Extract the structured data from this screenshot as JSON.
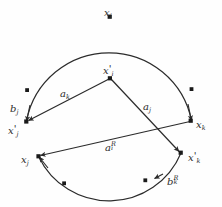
{
  "figure": {
    "type": "geometric-diagram",
    "background_color": "#fefefe",
    "stroke_color": "#2b2b2b",
    "text_color": "#2b2b2b"
  },
  "labels": {
    "x_i": {
      "base": "x",
      "sub": "i",
      "prime": "",
      "sup": ""
    },
    "x_i_prime": {
      "base": "x",
      "sub": "i",
      "prime": "'",
      "sup": ""
    },
    "x_j": {
      "base": "x",
      "sub": "j",
      "prime": "",
      "sup": ""
    },
    "x_j_prime": {
      "base": "x",
      "sub": "j",
      "prime": "'",
      "sup": ""
    },
    "x_k": {
      "base": "x",
      "sub": "k",
      "prime": "",
      "sup": ""
    },
    "x_k_prime": {
      "base": "x",
      "sub": "k",
      "prime": "'",
      "sup": ""
    },
    "a_k": {
      "base": "a",
      "sub": "k",
      "prime": "",
      "sup": ""
    },
    "a_j": {
      "base": "a",
      "sub": "j",
      "prime": "",
      "sup": ""
    },
    "a_i_R": {
      "base": "a",
      "sub": "i",
      "prime": "",
      "sup": "R"
    },
    "b_j": {
      "base": "b",
      "sub": "j",
      "prime": "",
      "sup": ""
    },
    "b_k_R": {
      "base": "b",
      "sub": "k",
      "prime": "",
      "sup": "R"
    }
  },
  "geometry": {
    "points": {
      "x_i": {
        "x": 110,
        "y": 17
      },
      "x_i_prime": {
        "x": 110,
        "y": 78
      },
      "x_j_prime": {
        "x": 26,
        "y": 122
      },
      "x_k": {
        "x": 191,
        "y": 121
      },
      "x_j": {
        "x": 38,
        "y": 156
      },
      "x_k_prime": {
        "x": 181,
        "y": 153
      }
    },
    "arc_dots": [
      {
        "x": 110,
        "y": 17
      },
      {
        "x": 27,
        "y": 90
      },
      {
        "x": 192,
        "y": 89
      },
      {
        "x": 64,
        "y": 183
      },
      {
        "x": 145,
        "y": 180
      }
    ],
    "edges": [
      {
        "name": "a_k",
        "from": "x_i_prime",
        "to": "x_j_prime",
        "kind": "straight-arrow"
      },
      {
        "name": "a_j",
        "from": "x_i_prime",
        "to": "x_k_prime",
        "kind": "straight-arrow"
      },
      {
        "name": "a_i_R",
        "from": "x_k",
        "to": "x_j",
        "kind": "straight-arrow"
      },
      {
        "name": "b_j",
        "from": "x_k",
        "to": "x_j_prime",
        "kind": "arc-upper"
      },
      {
        "name": "b_k_R",
        "from": "x_k_prime",
        "to": "x_j",
        "kind": "arc-lower"
      }
    ]
  }
}
